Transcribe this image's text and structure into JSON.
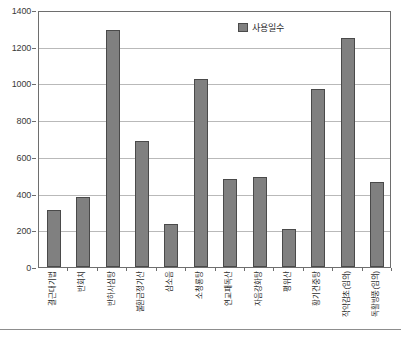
{
  "chart_data": {
    "type": "bar",
    "title": "",
    "xlabel": "",
    "ylabel": "",
    "ylim": [
      0,
      1400
    ],
    "ytick_step": 200,
    "grid": true,
    "legend_position": "top-right",
    "bar_color": "#808080",
    "bar_border_color": "#4a4a4a",
    "grid_color": "#b9b9b9",
    "axis_color": "#6e6e6e",
    "series": [
      {
        "name": "사용일수",
        "values": [
          310,
          382,
          1290,
          688,
          232,
          1025,
          480,
          490,
          205,
          972,
          1250,
          465
        ]
      }
    ],
    "categories": [
      "결근대기법",
      "반회치",
      "반하사심탕",
      "불환금정기산",
      "삼소음",
      "소청룡탕",
      "연교패독산",
      "자음강화탕",
      "평위산",
      "황기건중탕",
      "작약감초(임의)",
      "독활방풍(임의)"
    ],
    "ytick_labels": [
      "0",
      "200",
      "400",
      "600",
      "800",
      "1000",
      "1200",
      "1400"
    ]
  },
  "legend": {
    "swatch_name": "series-color-swatch",
    "label": "사용일수"
  }
}
